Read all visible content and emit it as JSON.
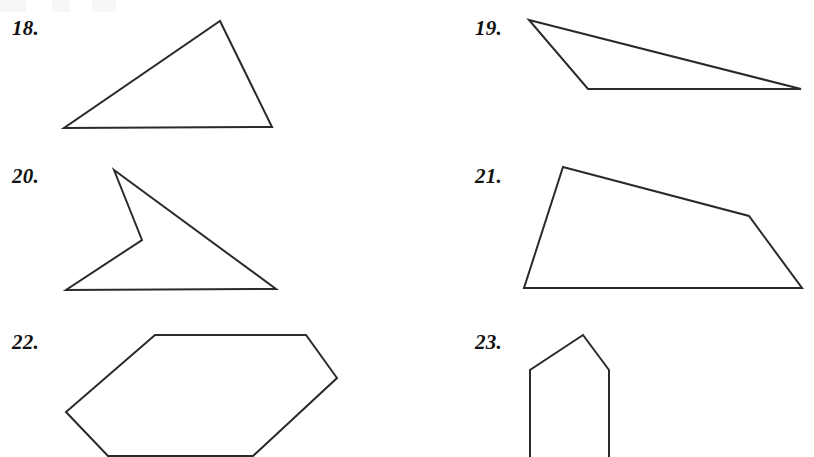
{
  "page": {
    "background_color": "#ffffff",
    "stroke_color": "#2a2a2a",
    "stroke_width": 2,
    "width": 814,
    "height": 457
  },
  "problems": [
    {
      "label": "18.",
      "label_x": 12,
      "label_y": 18,
      "shape_name": "triangle",
      "vertex_count": 3,
      "clipped": false,
      "points": "220,21 272,127 64,128"
    },
    {
      "label": "19.",
      "label_x": 475,
      "label_y": 18,
      "shape_name": "thin-triangle",
      "vertex_count": 3,
      "clipped": false,
      "points": "529,20 801,89 588,89"
    },
    {
      "label": "20.",
      "label_x": 12,
      "label_y": 166,
      "shape_name": "concave-quadrilateral",
      "vertex_count": 4,
      "clipped": false,
      "points": "114,170 276,289 66,290 142,240"
    },
    {
      "label": "21.",
      "label_x": 475,
      "label_y": 166,
      "shape_name": "pentagon",
      "vertex_count": 5,
      "clipped": false,
      "points": "563,167 749,216 802,288 524,288"
    },
    {
      "label": "22.",
      "label_x": 12,
      "label_y": 332,
      "shape_name": "hexagon",
      "vertex_count": 6,
      "clipped": true,
      "points": "155,335 306,335 337,378 253,456 108,456 66,412"
    },
    {
      "label": "23.",
      "label_x": 475,
      "label_y": 332,
      "shape_name": "house-pentagon",
      "vertex_count": 5,
      "clipped": true,
      "points": "530,458 530,370 583,335 609,370 609,458"
    }
  ]
}
